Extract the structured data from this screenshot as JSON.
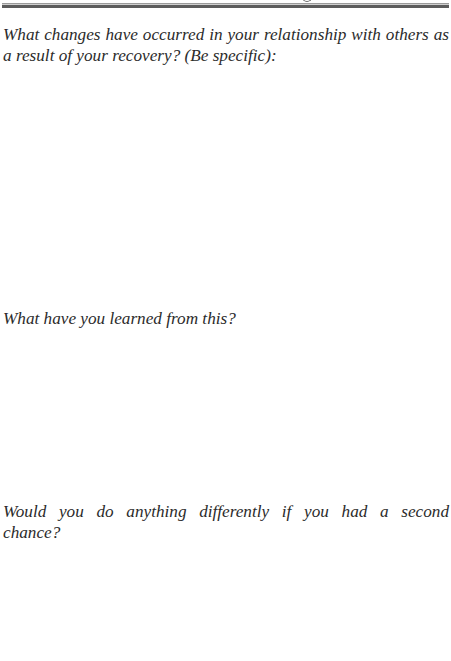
{
  "page": {
    "header": {
      "text_visible": false
    },
    "questions": [
      {
        "text": "What changes have occurred in your relationship with others as a result of your recovery? (Be specific):",
        "answer": ""
      },
      {
        "text": "What have you learned from this?",
        "answer": ""
      },
      {
        "text": "Would you do anything differently if you had a second chance?",
        "answer": ""
      }
    ]
  }
}
